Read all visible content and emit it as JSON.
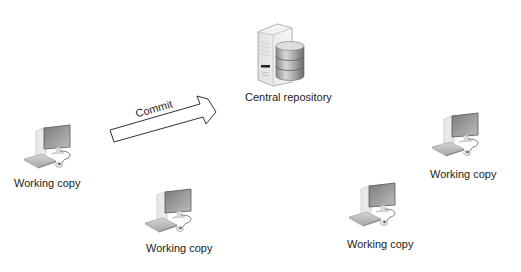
{
  "diagram": {
    "server": {
      "label": "Central repository"
    },
    "arrow": {
      "label": "Commit"
    },
    "clients": [
      {
        "label": "Working copy"
      },
      {
        "label": "Working copy"
      },
      {
        "label": "Working copy"
      },
      {
        "label": "Working copy"
      }
    ]
  }
}
